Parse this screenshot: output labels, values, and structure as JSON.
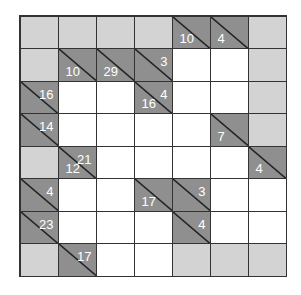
{
  "puzzle": {
    "type": "kakuro",
    "rows": 8,
    "cols": 7,
    "colors": {
      "clue": "#8f8f8f",
      "blocked": "#d3d3d3",
      "empty": "#ffffff",
      "line": "#333333",
      "text": "#ffffff"
    },
    "grid": [
      [
        {
          "t": "g"
        },
        {
          "t": "g"
        },
        {
          "t": "g"
        },
        {
          "t": "g"
        },
        {
          "t": "c",
          "down": "10"
        },
        {
          "t": "c",
          "down": "4"
        },
        {
          "t": "g"
        }
      ],
      [
        {
          "t": "g"
        },
        {
          "t": "c",
          "down": "10"
        },
        {
          "t": "c",
          "down": "29"
        },
        {
          "t": "c",
          "across": "3"
        },
        {
          "t": "w"
        },
        {
          "t": "w"
        },
        {
          "t": "g"
        }
      ],
      [
        {
          "t": "c",
          "across": "16"
        },
        {
          "t": "w"
        },
        {
          "t": "w"
        },
        {
          "t": "c",
          "down": "16",
          "across": "4"
        },
        {
          "t": "w"
        },
        {
          "t": "w"
        },
        {
          "t": "g"
        }
      ],
      [
        {
          "t": "c",
          "across": "14"
        },
        {
          "t": "w"
        },
        {
          "t": "w"
        },
        {
          "t": "w"
        },
        {
          "t": "w"
        },
        {
          "t": "c",
          "down": "7"
        },
        {
          "t": "g"
        }
      ],
      [
        {
          "t": "g"
        },
        {
          "t": "c",
          "down": "12",
          "across": "21"
        },
        {
          "t": "w"
        },
        {
          "t": "w"
        },
        {
          "t": "w"
        },
        {
          "t": "w"
        },
        {
          "t": "c",
          "down": "4"
        }
      ],
      [
        {
          "t": "c",
          "across": "4"
        },
        {
          "t": "w"
        },
        {
          "t": "w"
        },
        {
          "t": "c",
          "down": "17"
        },
        {
          "t": "c",
          "across": "3"
        },
        {
          "t": "w"
        },
        {
          "t": "w"
        }
      ],
      [
        {
          "t": "c",
          "across": "23"
        },
        {
          "t": "w"
        },
        {
          "t": "w"
        },
        {
          "t": "w"
        },
        {
          "t": "c",
          "across": "4"
        },
        {
          "t": "w"
        },
        {
          "t": "w"
        }
      ],
      [
        {
          "t": "g"
        },
        {
          "t": "c",
          "across": "17"
        },
        {
          "t": "w"
        },
        {
          "t": "w"
        },
        {
          "t": "g"
        },
        {
          "t": "g"
        },
        {
          "t": "g"
        }
      ]
    ]
  }
}
